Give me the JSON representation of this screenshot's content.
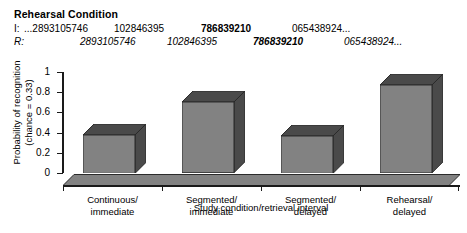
{
  "header": {
    "condition_title": "Rehearsal Condition",
    "rows": [
      {
        "label": "I:",
        "tokens": [
          {
            "text": "...2893105746",
            "bold": false
          },
          {
            "text": "102846395",
            "bold": false
          },
          {
            "text": "786839210",
            "bold": true
          },
          {
            "text": "065438924...",
            "bold": false
          }
        ]
      },
      {
        "label": "R:",
        "tokens": [
          {
            "text": "2893105746",
            "bold": false
          },
          {
            "text": "102846395",
            "bold": false
          },
          {
            "text": "786839210",
            "bold": true
          },
          {
            "text": "065438924...",
            "bold": false
          }
        ]
      }
    ]
  },
  "chart_data": {
    "type": "bar",
    "title": "",
    "categories": [
      "Continuous/\nimmediate",
      "Segmented/\nimmediate",
      "Segmented/\ndelayed",
      "Rehearsal/\ndelayed"
    ],
    "category_lines": [
      [
        "Continuous/",
        "immediate"
      ],
      [
        "Segmented/",
        "immediate"
      ],
      [
        "Segmented/",
        "delayed"
      ],
      [
        "Rehearsal/",
        "delayed"
      ]
    ],
    "values": [
      0.38,
      0.7,
      0.37,
      0.87
    ],
    "xlabel": "Study condition/retrieval interval",
    "ylabel_line1": "Probability of recognition",
    "ylabel_line2": "(chance = 0.33)",
    "ylim": [
      0,
      1
    ],
    "yticks": [
      0,
      0.2,
      0.4,
      0.6,
      0.8,
      1
    ],
    "ytick_labels": [
      "0",
      "0.2",
      "0.4",
      "0.6",
      "0.8",
      "1"
    ],
    "grid": false,
    "legend": "none",
    "bar_face_color": "#828282",
    "bar_shade_color": "#4a4a4a",
    "axis_color": "#1a1a1a",
    "three_d": true
  }
}
